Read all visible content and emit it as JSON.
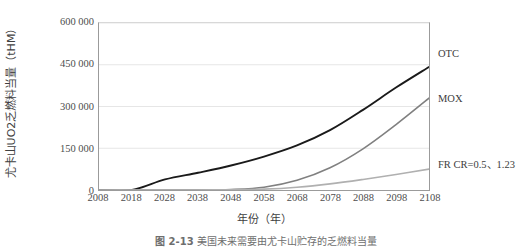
{
  "chart_data": {
    "type": "line",
    "title": "",
    "xlabel": "年份（年）",
    "ylabel": "尤卡山UO2乏燃料当量（tHM）",
    "xlim": [
      2008,
      2108
    ],
    "ylim": [
      0,
      600000
    ],
    "grid": true,
    "legend_position": "inline-right",
    "xticks": [
      "2008",
      "2018",
      "2028",
      "2038",
      "2048",
      "2058",
      "2068",
      "2078",
      "2088",
      "2098",
      "2108"
    ],
    "yticks": [
      "0",
      "150 000",
      "300 000",
      "450 000",
      "600 000"
    ],
    "ytick_values": [
      0,
      150000,
      300000,
      450000,
      600000
    ],
    "x": [
      2008,
      2018,
      2028,
      2038,
      2048,
      2058,
      2068,
      2078,
      2088,
      2098,
      2108
    ],
    "series": [
      {
        "name": "OTC",
        "color": "#1a1a1a",
        "label": "OTC",
        "values": [
          0,
          0,
          38000,
          62000,
          88000,
          120000,
          160000,
          215000,
          288000,
          368000,
          442000
        ]
      },
      {
        "name": "MOX",
        "color": "#808080",
        "label": "MOX",
        "values": [
          0,
          0,
          0,
          0,
          2000,
          10000,
          35000,
          80000,
          148000,
          235000,
          330000
        ]
      },
      {
        "name": "FR CR",
        "color": "#b0b0b0",
        "label": "FR CR=0.5、1.23",
        "values": [
          0,
          0,
          0,
          0,
          1000,
          3000,
          10000,
          22000,
          38000,
          56000,
          75000
        ]
      }
    ]
  },
  "caption": {
    "number": "图 2-13",
    "text": "美国未来需要由尤卡山贮存的乏燃料当量"
  }
}
